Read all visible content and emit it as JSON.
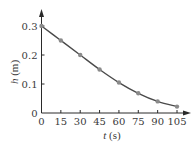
{
  "chart_data": {
    "type": "scatter",
    "title": "",
    "xlabel": "t (s)",
    "xlabel_var": "t",
    "xlabel_unit": "(s)",
    "ylabel": "h (m)",
    "ylabel_var": "h",
    "ylabel_unit": "(m)",
    "xlim": [
      0,
      105
    ],
    "ylim": [
      0,
      0.3
    ],
    "xticks": [
      "0",
      "15",
      "30",
      "45",
      "60",
      "75",
      "90",
      "105"
    ],
    "yticks": [
      "0",
      "0.1",
      "0.2",
      "0.3"
    ],
    "grid": false,
    "legend": null,
    "series": [
      {
        "name": "measured",
        "kind": "points",
        "x": [
          0,
          15,
          30,
          45,
          60,
          75,
          90,
          105
        ],
        "y": [
          0.3,
          0.25,
          0.2,
          0.15,
          0.105,
          0.068,
          0.04,
          0.022
        ]
      },
      {
        "name": "fit",
        "kind": "smooth-curve",
        "x": [
          0,
          15,
          30,
          45,
          60,
          75,
          90,
          105
        ],
        "y": [
          0.3,
          0.25,
          0.2,
          0.15,
          0.105,
          0.068,
          0.04,
          0.022
        ]
      }
    ],
    "colors": {
      "axis": "#2a2a2a",
      "curve": "#4a4a4a",
      "points": "#8a8a8a",
      "text": "#3a3a3a"
    }
  }
}
